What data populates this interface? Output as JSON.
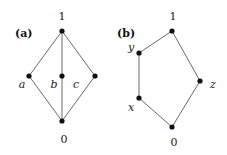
{
  "diagrams": [
    {
      "panel_label": "(a)",
      "name": "M3 lattice",
      "nodes": {
        "top": {
          "label": "1",
          "x": 62,
          "y": 31
        },
        "a": {
          "label": "a",
          "x": 29,
          "y": 76
        },
        "b": {
          "label": "b",
          "x": 62,
          "y": 76
        },
        "c": {
          "label": "c",
          "x": 95,
          "y": 76
        },
        "bottom": {
          "label": "0",
          "x": 62,
          "y": 121
        }
      },
      "edges": [
        [
          "top",
          "a"
        ],
        [
          "top",
          "b"
        ],
        [
          "top",
          "c"
        ],
        [
          "a",
          "bottom"
        ],
        [
          "b",
          "bottom"
        ],
        [
          "c",
          "bottom"
        ]
      ]
    },
    {
      "panel_label": "(b)",
      "name": "N5 lattice",
      "nodes": {
        "top": {
          "label": "1",
          "x": 172,
          "y": 31
        },
        "y": {
          "label": "y",
          "x": 139,
          "y": 53
        },
        "x": {
          "label": "x",
          "x": 139,
          "y": 98
        },
        "z": {
          "label": "z",
          "x": 200,
          "y": 81
        },
        "bottom": {
          "label": "0",
          "x": 172,
          "y": 127
        }
      },
      "edges": [
        [
          "top",
          "y"
        ],
        [
          "y",
          "x"
        ],
        [
          "x",
          "bottom"
        ],
        [
          "top",
          "z"
        ],
        [
          "z",
          "bottom"
        ]
      ]
    }
  ]
}
